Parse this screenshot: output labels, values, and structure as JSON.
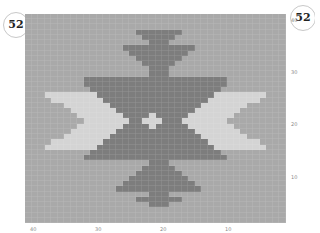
{
  "page": {
    "number_left": "52",
    "number_right": "52"
  },
  "chart_data": {
    "type": "heatmap",
    "title": "",
    "columns": 40,
    "rows": 40,
    "palette": {
      "B": "#a9a9a9",
      "D": "#7d7d7d",
      "L": "#d4d4d4"
    },
    "x_axis_labels": [
      {
        "label": "40",
        "x": 30
      },
      {
        "label": "30",
        "x": 95
      },
      {
        "label": "20",
        "x": 160
      },
      {
        "label": "10",
        "x": 225
      }
    ],
    "y_axis_labels": [
      {
        "label": "40",
        "y": 17
      },
      {
        "label": "30",
        "y": 69
      },
      {
        "label": "20",
        "y": 121
      },
      {
        "label": "10",
        "y": 174
      }
    ],
    "grid": [
      "BBBBBBBBBBBBBBBBBBBBBBBBBBBBBBBBBBBBBBBB",
      "BBBBBBBBBBBBBBBBBBBBBBBBBBBBBBBBBBBBBBBB",
      "BBBBBBBBBBBBBBBBBBBBBBBBBBBBBBBBBBBBBBBB",
      "BBBBBBBBBBBBBBBBBDDDDDDDBBBBBBBBBBBBBBBB",
      "BBBBBBBBBBBBBBBBBBDDDDDBBBBBBBBBBBBBBBBB",
      "BBBBBBBBBBBBBBBBBBBDDDBBBBBBBBBBBBBBBBBB",
      "BBBBBBBBBBBBBBBDDDDDDDDDDDBBBBBBBBBBBBBB",
      "BBBBBBBBBBBBBBBBDDDDDDDDDBBBBBBBBBBBBBBB",
      "BBBBBBBBBBBBBBBBBDDDDDDDBBBBBBBBBBBBBBBB",
      "BBBBBBBBBBBBBBBBBBDDDDDBBBBBBBBBBBBBBBBB",
      "BBBBBBBBBBBBBBBBBBBDDDBBBBBBBBBBBBBBBBBB",
      "BBBBBBBBBBBBBBBBBBBDDDBBBBBBBBBBBBBBBBBB",
      "BBBBBBBBBDDDDDDDDDDDDDDDDDDDDDDBBBBBBBBB",
      "BBBBBBBBBDDDDDDDDDDDDDDDDDDDDDDBBBBBBBBB",
      "BBBBBBBBBBDDDDDDDDDDDDDDDDDDDDBBBBBBBBBB",
      "BBBLLLLLLLLDDDDDDDDDDDDDDDDDDLLLLLLLLBBB",
      "BBBBLLLLLLLLDDDDDDDDDDDDDDDDLLLLLLLLBBBB",
      "BBBBBBLLLLLLLDDDDDDDDDDDDDDLLLLLLLBBBBBB",
      "BBBBBBBLLLLLLLDDDDDDDDDDDDLLLLLLLBBBBBBB",
      "BBBBBBBBLLLLLLLDDDDLDDDDDLLLLLLLBBBBBBBB",
      "BBBBBBBBBLLLLLLLDDLLLDDDLLLLLLLBBBBBBBBB",
      "BBBBBBBBLLLLLLLDDDDLDDDDDLLLLLLLBBBBBBBB",
      "BBBBBBBLLLLLLLDDDDDDDDDDDDLLLLLLLBBBBBBB",
      "BBBBBBLLLLLLLDDDDDDDDDDDDDDLLLLLLLBBBBBB",
      "BBBBLLLLLLLLDDDDDDDDDDDDDDDDLLLLLLLLBBBB",
      "BBBLLLLLLLLDDDDDDDDDDDDDDDDDDLLLLLLLLBBB",
      "BBBBBBBBBBDDDDDDDDDDDDDDDDDDDDBBBBBBBBBB",
      "BBBBBBBBBDDDDDDDDDDDDDDDDDDDDDDBBBBBBBBB",
      "BBBBBBBBBBBBBBBBBBBDDDBBBBBBBBBBBBBBBBBB",
      "BBBBBBBBBBBBBBBBBBDDDDDBBBBBBBBBBBBBBBBB",
      "BBBBBBBBBBBBBBBBBDDDDDDDBBBBBBBBBBBBBBBB",
      "BBBBBBBBBBBBBBBBDDDDDDDDDBBBBBBBBBBBBBBB",
      "BBBBBBBBBBBBBBBDDDDDDDDDDDBBBBBBBBBBBBBB",
      "BBBBBBBBBBBBBBDDDDDDDDDDDDDBBBBBBBBBBBBB",
      "BBBBBBBBBBBBBBBBBBBDDDBBBBBBBBBBBBBBBBBB",
      "BBBBBBBBBBBBBBBBBDDDDDDDBBBBBBBBBBBBBBBB",
      "BBBBBBBBBBBBBBBBBBBDDDBBBBBBBBBBBBBBBBBB",
      "BBBBBBBBBBBBBBBBBBBBBBBBBBBBBBBBBBBBBBBB",
      "BBBBBBBBBBBBBBBBBBBBBBBBBBBBBBBBBBBBBBBB",
      "BBBBBBBBBBBBBBBBBBBBBBBBBBBBBBBBBBBBBBBB"
    ]
  }
}
